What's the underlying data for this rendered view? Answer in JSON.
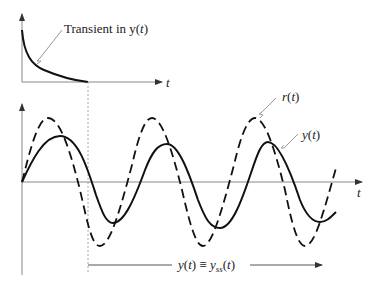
{
  "diagram": {
    "top_plot": {
      "annotation": "Transient in y(t)",
      "annotation_parts": {
        "pre": "Transient in y(",
        "var": "t",
        "post": ")"
      },
      "axis_label": "t"
    },
    "bottom_plot": {
      "axis_label": "t",
      "series": [
        {
          "name": "r(t)",
          "label_fn": "r(",
          "label_var": "t",
          "label_post": ")",
          "style": "dashed"
        },
        {
          "name": "y(t)",
          "label_fn": "y(",
          "label_var": "t",
          "label_post": ")",
          "style": "solid"
        }
      ],
      "steady_state_label": "y(t) ≡ y_ss(t)",
      "steady_state_parts": {
        "lhs": "y(t) ≡ y",
        "sub": "ss",
        "rhs": "(t)"
      }
    },
    "colors": {
      "curve": "#111111",
      "axis": "#888888",
      "leader": "#999999"
    }
  }
}
